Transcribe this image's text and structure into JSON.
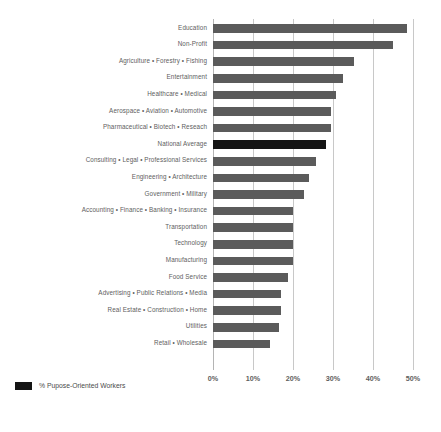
{
  "chart_data": {
    "type": "bar",
    "orientation": "horizontal",
    "title": "",
    "subtitle": "",
    "xlabel": "",
    "ylabel": "",
    "xlim": [
      0,
      50
    ],
    "grid": true,
    "legend_position": "bottom",
    "legend": [
      "% Pupose-Oriented Workers"
    ],
    "highlight_category": "National Average",
    "colors": {
      "bar": "#5b5b5b",
      "highlight_bar": "#151515",
      "gridline": "#c8c8c8",
      "text": "#5e5e5e",
      "background": "#ffffff"
    },
    "categories": [
      "Education",
      "Non-Profit",
      "Agriculture • Forestry • Fishing",
      "Entertainment",
      "Healthcare • Medical",
      "Aerospace • Aviation • Automotive",
      "Pharmaceutical • Biotech • Reseach",
      "National Average",
      "Consulting • Legal • Professional Services",
      "Engineering • Architecture",
      "Government • Military",
      "Accounting • Finance • Banking • Insurance",
      "Transportation",
      "Technology",
      "Manufacturing",
      "Food Service",
      "Advertising • Public Relations • Media",
      "Real Estate • Construction • Home",
      "Utilities",
      "Retail • Wholesale"
    ],
    "values": [
      48.5,
      45,
      35.3,
      32.4,
      30.8,
      29.6,
      29.5,
      28.3,
      25.8,
      24,
      22.7,
      20,
      20,
      20,
      20,
      18.8,
      17,
      17,
      16.5,
      14.2
    ],
    "xticks": [
      0,
      10,
      20,
      30,
      40,
      50
    ],
    "xticklabels": [
      "0%",
      "10%",
      "20%",
      "30%",
      "40%",
      "50%"
    ]
  },
  "legend": {
    "series_label": "% Pupose-Oriented Workers"
  }
}
